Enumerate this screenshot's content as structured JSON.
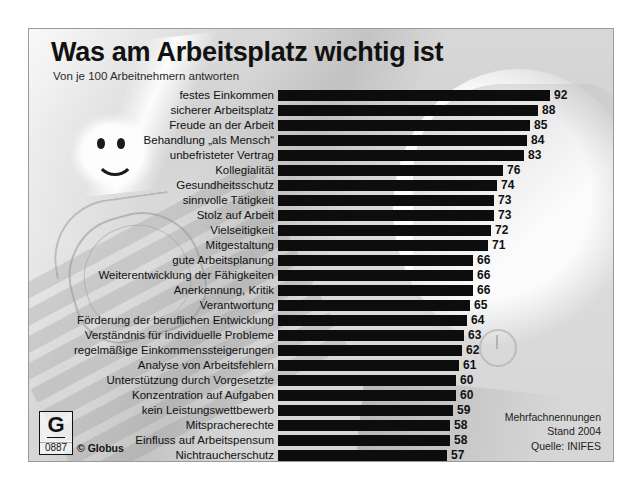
{
  "header": {
    "title": "Was am Arbeitsplatz wichtig ist",
    "subtitle": "Von je 100 Arbeitnehmern antworten"
  },
  "footer": {
    "note_multiple": "Mehrfachnennungen",
    "note_date": "Stand 2004",
    "note_source": "Quelle: INIFES",
    "logo_letter": "G",
    "logo_number": "0887",
    "logo_text": "© Globus"
  },
  "chart_data": {
    "type": "bar",
    "orientation": "horizontal",
    "title": "Was am Arbeitsplatz wichtig ist",
    "subtitle": "Von je 100 Arbeitnehmern antworten",
    "xlabel": "",
    "ylabel": "",
    "xlim": [
      0,
      100
    ],
    "grid": false,
    "legend": false,
    "bar_color": "#0d0d0d",
    "categories": [
      "festes Einkommen",
      "sicherer Arbeitsplatz",
      "Freude an der Arbeit",
      "Behandlung „als Mensch“",
      "unbefristeter Vertrag",
      "Kollegialität",
      "Gesundheitsschutz",
      "sinnvolle Tätigkeit",
      "Stolz auf Arbeit",
      "Vielseitigkeit",
      "Mitgestaltung",
      "gute Arbeitsplanung",
      "Weiterentwicklung der Fähigkeiten",
      "Anerkennung, Kritik",
      "Verantwortung",
      "Förderung der beruflichen Entwicklung",
      "Verständnis für individuelle Probleme",
      "regelmäßige Einkommenssteigerungen",
      "Analyse von Arbeitsfehlern",
      "Unterstützung durch Vorgesetzte",
      "Konzentration auf Aufgaben",
      "kein Leistungswettbewerb",
      "Mitspracherechte",
      "Einfluss auf Arbeitspensum",
      "Nichtraucherschutz"
    ],
    "values": [
      92,
      88,
      85,
      84,
      83,
      76,
      74,
      73,
      73,
      72,
      71,
      66,
      66,
      66,
      65,
      64,
      63,
      62,
      61,
      60,
      60,
      59,
      58,
      58,
      57
    ],
    "annotations": [
      "Mehrfachnennungen",
      "Stand 2004",
      "Quelle: INIFES"
    ]
  }
}
